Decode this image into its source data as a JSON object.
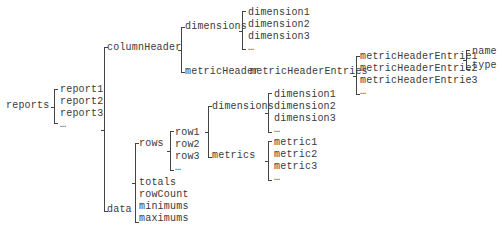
{
  "root": "reports",
  "reports": [
    "report1",
    "report2",
    "report3",
    "…"
  ],
  "report_children": [
    "columnHeader",
    "data"
  ],
  "columnHeader": {
    "children": [
      "dimensions",
      "metricHeader"
    ],
    "dimensions": [
      "dimension1",
      "dimension2",
      "dimension3",
      "…"
    ],
    "metricHeader": {
      "label": "metricHeaderEntries",
      "entries": [
        "metricHeaderEntrie1",
        "metricHeaderEntrie2",
        "metricHeaderEntrie3",
        "…"
      ],
      "entry_fields": [
        "name",
        "type"
      ]
    }
  },
  "data": {
    "children": [
      "rows",
      "totals",
      "rowCount",
      "minimums",
      "maximums"
    ],
    "rows": [
      "row1",
      "row2",
      "row3",
      "…"
    ],
    "row_children": [
      "dimensions",
      "metrics"
    ],
    "row_dimensions": [
      "dimension1",
      "dimension2",
      "dimension3",
      "…"
    ],
    "row_metrics": [
      "metric1",
      "metric2",
      "metric3",
      "…"
    ]
  }
}
